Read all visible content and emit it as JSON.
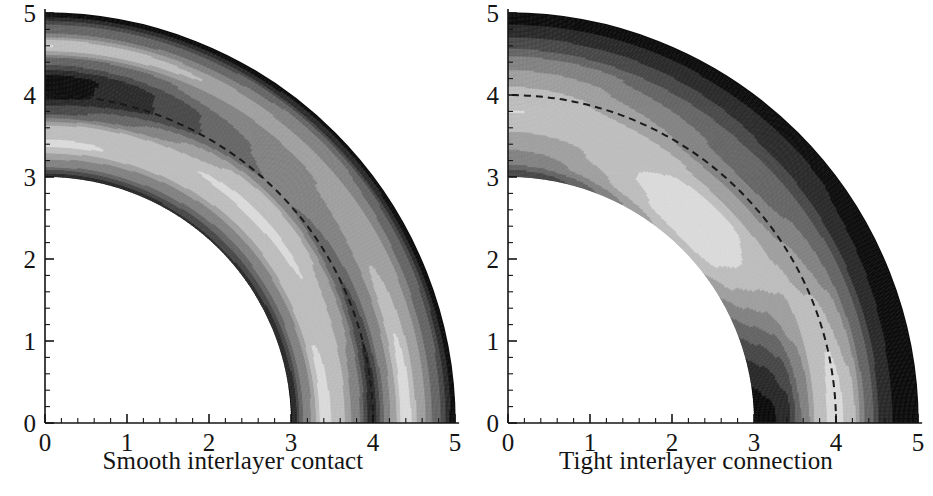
{
  "figure": {
    "background": "#ffffff",
    "ink": "#141414"
  },
  "panels": [
    {
      "id": "left",
      "caption": "Smooth interlayer contact",
      "axes": {
        "x_ticks": [
          "0",
          "1",
          "2",
          "3",
          "4",
          "5"
        ],
        "y_ticks": [
          "0",
          "1",
          "2",
          "3",
          "4",
          "5"
        ],
        "x_min": 0,
        "x_max": 5,
        "y_min": 0,
        "y_max": 5,
        "minor_ticks_per_interval": 5
      },
      "geometry": {
        "inner_radius": 3,
        "outer_radius": 5,
        "interface_radius": 4,
        "interface_style": "dashed"
      },
      "chart_data": {
        "type": "heatmap",
        "title": "Smooth interlayer contact",
        "xlabel": "Smooth interlayer contact",
        "ylabel": "",
        "xlim": [
          0,
          5
        ],
        "ylim": [
          0,
          5
        ],
        "grid": false,
        "legend": "none",
        "colormap": "grayscale",
        "domain": "quarter annulus, inner radius 3, outer radius 5",
        "interface_radius": 4,
        "description": "Grayscale contour field over a quarter annulus. Along the vertical axis (theta = 90 deg) the field shows strong alternating bands: very dark at r = 5, light at r = 4.6, very dark at r = 4.0-4.2, light at r = 3.5, mid-gray at r = 3.2, dark at r = 3. Along the horizontal axis (theta = 0 deg) bands are: dark at r = 3, light at r = 3.5, mid at r = 3.8, dark near r = 4.0, light at r = 4.3, mid-gray, dark at r = 5.",
        "radial_profiles": [
          {
            "theta_deg": 90,
            "r": [
              3.0,
              3.2,
              3.4,
              3.6,
              3.8,
              4.0,
              4.2,
              4.4,
              4.6,
              4.8,
              5.0
            ],
            "level": [
              0.18,
              0.55,
              0.8,
              0.7,
              0.3,
              0.08,
              0.07,
              0.35,
              0.78,
              0.4,
              0.05
            ]
          },
          {
            "theta_deg": 45,
            "r": [
              3.0,
              3.2,
              3.4,
              3.6,
              3.8,
              4.0,
              4.2,
              4.4,
              4.6,
              4.8,
              5.0
            ],
            "level": [
              0.2,
              0.45,
              0.68,
              0.8,
              0.72,
              0.45,
              0.48,
              0.55,
              0.58,
              0.45,
              0.08
            ]
          },
          {
            "theta_deg": 0,
            "r": [
              3.0,
              3.2,
              3.4,
              3.6,
              3.8,
              4.0,
              4.2,
              4.4,
              4.6,
              4.8,
              5.0
            ],
            "level": [
              0.1,
              0.5,
              0.82,
              0.72,
              0.5,
              0.15,
              0.55,
              0.85,
              0.6,
              0.35,
              0.06
            ]
          }
        ]
      }
    },
    {
      "id": "right",
      "caption": "Tight interlayer connection",
      "axes": {
        "x_ticks": [
          "0",
          "1",
          "2",
          "3",
          "4",
          "5"
        ],
        "y_ticks": [
          "0",
          "1",
          "2",
          "3",
          "4",
          "5"
        ],
        "x_min": 0,
        "x_max": 5,
        "y_min": 0,
        "y_max": 5,
        "minor_ticks_per_interval": 5
      },
      "geometry": {
        "inner_radius": 3,
        "outer_radius": 5,
        "interface_radius": 4,
        "interface_style": "dashed"
      },
      "chart_data": {
        "type": "heatmap",
        "title": "Tight interlayer connection",
        "xlabel": "Tight interlayer connection",
        "ylabel": "",
        "xlim": [
          0,
          5
        ],
        "ylim": [
          0,
          5
        ],
        "grid": false,
        "legend": "none",
        "colormap": "grayscale",
        "domain": "quarter annulus, inner radius 3, outer radius 5",
        "interface_radius": 4,
        "description": "Grayscale contour field over a quarter annulus with smoother, broader bands than the left panel. Along the vertical axis the field is very dark at r = 5, brightening monotonically inward to a light plateau near r = 3.7-4.3, then mid-gray toward r = 3 with a thin dark rim at r = 3. Along the horizontal axis a very dark core sits at r = 3-3.6, a bright band peaks near r = 4.1, and a very dark band occupies r = 4.6-5.0.",
        "radial_profiles": [
          {
            "theta_deg": 90,
            "r": [
              3.0,
              3.2,
              3.4,
              3.6,
              3.8,
              4.0,
              4.2,
              4.4,
              4.6,
              4.8,
              5.0
            ],
            "level": [
              0.22,
              0.48,
              0.58,
              0.68,
              0.78,
              0.72,
              0.62,
              0.5,
              0.32,
              0.14,
              0.03
            ]
          },
          {
            "theta_deg": 45,
            "r": [
              3.0,
              3.2,
              3.4,
              3.6,
              3.8,
              4.0,
              4.2,
              4.4,
              4.6,
              4.8,
              5.0
            ],
            "level": [
              0.72,
              0.85,
              0.88,
              0.8,
              0.65,
              0.5,
              0.42,
              0.35,
              0.22,
              0.12,
              0.05
            ]
          },
          {
            "theta_deg": 0,
            "r": [
              3.0,
              3.2,
              3.4,
              3.6,
              3.8,
              4.0,
              4.2,
              4.4,
              4.6,
              4.8,
              5.0
            ],
            "level": [
              0.05,
              0.08,
              0.18,
              0.45,
              0.72,
              0.85,
              0.7,
              0.4,
              0.15,
              0.05,
              0.02
            ]
          }
        ]
      }
    }
  ]
}
